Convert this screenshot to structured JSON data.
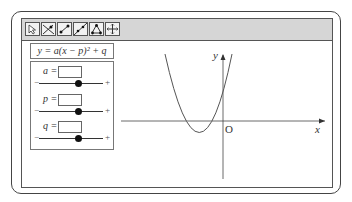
{
  "toolbar": {
    "tools": [
      {
        "name": "pointer-tool",
        "icon": "arrow-pointer-icon"
      },
      {
        "name": "line-through-point-tool",
        "icon": "line-point-icon"
      },
      {
        "name": "segment-tool",
        "icon": "segment-icon"
      },
      {
        "name": "line-tool",
        "icon": "line-icon"
      },
      {
        "name": "polygon-tool",
        "icon": "triangle-icon"
      },
      {
        "name": "move-view-tool",
        "icon": "crosshair-move-icon"
      }
    ]
  },
  "formula": "y = a(x − p)² + q",
  "sliders": [
    {
      "label": "a =",
      "value": "",
      "minus": "−",
      "plus": "+",
      "position": 0.62
    },
    {
      "label": "p =",
      "value": "",
      "minus": "−",
      "plus": "+",
      "position": 0.62
    },
    {
      "label": "q =",
      "value": "",
      "minus": "−",
      "plus": "+",
      "position": 0.62
    }
  ],
  "graph": {
    "x_label": "x",
    "y_label": "y",
    "origin_label": "O"
  }
}
